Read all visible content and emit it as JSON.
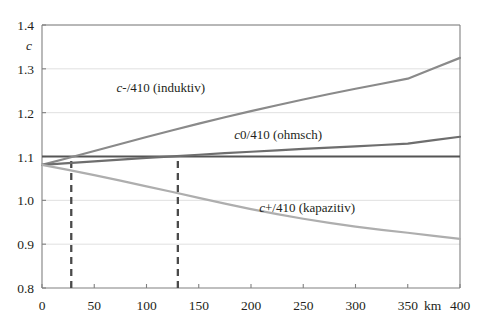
{
  "chart_data": {
    "type": "line",
    "title": "",
    "xlabel": "km",
    "ylabel": "c",
    "xlim": [
      0,
      400
    ],
    "ylim": [
      0.8,
      1.4
    ],
    "grid": true,
    "grid_axis": "y",
    "legend_position": "inline-annotations",
    "x_ticks": [
      0,
      50,
      100,
      150,
      200,
      250,
      300,
      350,
      400
    ],
    "x_tick_labels": [
      "0",
      "50",
      "100",
      "150",
      "200",
      "250",
      "300",
      "350",
      "400"
    ],
    "x_unit_label": "km",
    "y_ticks": [
      0.8,
      0.9,
      1.0,
      1.1,
      1.2,
      1.3,
      1.4
    ],
    "y_tick_labels": [
      "0.8",
      "0.9",
      "1.0",
      "1.1",
      "1.2",
      "1.3",
      "1.4"
    ],
    "x": [
      0,
      25,
      50,
      75,
      100,
      125,
      150,
      175,
      200,
      225,
      250,
      275,
      300,
      325,
      350,
      375,
      400
    ],
    "series": [
      {
        "name": "c-/410 (induktiv)",
        "label_html": "<tspan class=\"it\">c</tspan>-/410 (induktiv)",
        "color": "#8a8a8a",
        "width": 2.2,
        "label_x": 205,
        "label_y": 92,
        "values": [
          1.081,
          1.0965,
          1.1125,
          1.1285,
          1.1445,
          1.16,
          1.175,
          1.1895,
          1.2035,
          1.217,
          1.23,
          1.2425,
          1.2545,
          1.266,
          1.2775,
          1.3015,
          1.325
        ]
      },
      {
        "name": "c0/410 (ohmsch)",
        "label_html": "<tspan class=\"it\">c</tspan>0/410 (ohmsch)",
        "color": "#6e6e6e",
        "width": 2.2,
        "label_x": 322,
        "label_y": 139,
        "values": [
          1.081,
          1.085,
          1.089,
          1.093,
          1.0968,
          1.1005,
          1.104,
          1.1075,
          1.1108,
          1.114,
          1.1172,
          1.1202,
          1.1232,
          1.1262,
          1.1292,
          1.1372,
          1.145
        ]
      },
      {
        "name": "c+/410 (kapazitiv)",
        "label_html": "<tspan class=\"it\">c</tspan>+/410 (kapazitiv)",
        "color": "#aeaeae",
        "width": 2.2,
        "label_x": 355,
        "label_y": 212,
        "values": [
          1.081,
          1.0695,
          1.0575,
          1.045,
          1.032,
          1.019,
          1.0055,
          0.9925,
          0.98,
          0.9685,
          0.958,
          0.9485,
          0.94,
          0.9325,
          0.926,
          0.919,
          0.912
        ]
      }
    ],
    "reference_line": {
      "name": "c = 1.1 reference",
      "value": 1.1,
      "color": "#555555",
      "width": 2.2
    },
    "markers": [
      {
        "name": "marker-28km",
        "x": 28,
        "style": "dashed",
        "color": "#4a4a4a",
        "from_y": 0.8,
        "to_y": 1.1
      },
      {
        "name": "marker-130km",
        "x": 130,
        "style": "dashed",
        "color": "#4a4a4a",
        "from_y": 0.8,
        "to_y": 1.1
      }
    ]
  },
  "axis": {
    "y_name": "c",
    "x_unit": "km"
  },
  "plot_box": {
    "left": 42,
    "right": 460,
    "top": 25,
    "bottom": 288
  },
  "colors": {
    "axis": "#808080",
    "grid": "#e0e0e0",
    "text": "#231f20",
    "induktiv": "#8a8a8a",
    "ohmsch": "#6e6e6e",
    "kapazitiv": "#aeaeae",
    "reference": "#555555",
    "marker": "#4a4a4a",
    "background": "#ffffff"
  }
}
